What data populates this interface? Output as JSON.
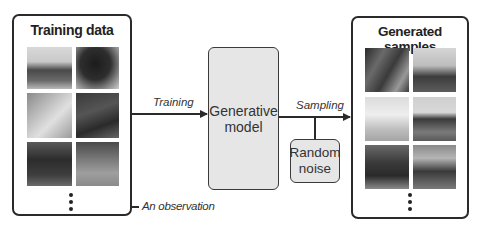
{
  "training_panel": {
    "title": "Training data",
    "images": [
      {
        "subject": "horse head, light background, dark bay",
        "tone": "light"
      },
      {
        "subject": "dark horse head close-up",
        "tone": "dark"
      },
      {
        "subject": "light horse head with fence",
        "tone": "mid-light"
      },
      {
        "subject": "dark horse with bridle close-up",
        "tone": "dark"
      },
      {
        "subject": "horse in dark paddock",
        "tone": "dark"
      },
      {
        "subject": "horse standing in field",
        "tone": "mid"
      }
    ],
    "more_indicator": "vertical-ellipsis"
  },
  "model_box": {
    "label_line1": "Generative",
    "label_line2": "model"
  },
  "noise_box": {
    "label_line1": "Random",
    "label_line2": "noise"
  },
  "arrows": {
    "training_label": "Training",
    "sampling_label": "Sampling",
    "observation_label": "An observation"
  },
  "generated_panel": {
    "title": "Generated samples",
    "images": [
      {
        "subject": "blurred horse close-up with person",
        "tone": "dark"
      },
      {
        "subject": "horse standing, light sky",
        "tone": "mid"
      },
      {
        "subject": "white horse in field",
        "tone": "light"
      },
      {
        "subject": "dark horse standing front view",
        "tone": "mid"
      },
      {
        "subject": "galloping dark horse",
        "tone": "dark"
      },
      {
        "subject": "galloping horse in arena",
        "tone": "mid"
      }
    ],
    "more_indicator": "vertical-ellipsis"
  },
  "colors": {
    "stroke": "#2a2a2a",
    "model_fill": "#e6e6e6",
    "background": "#ffffff"
  }
}
